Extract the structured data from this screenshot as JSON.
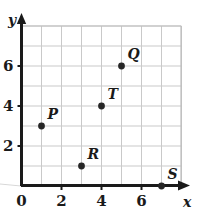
{
  "chart_data": {
    "type": "scatter",
    "title": "",
    "xlabel": "x",
    "ylabel": "y",
    "xlim": [
      0,
      8
    ],
    "ylim": [
      0,
      8
    ],
    "grid": true,
    "grid_step": 1,
    "legend": "none",
    "x_ticks": [
      {
        "value": 0,
        "label": "0"
      },
      {
        "value": 2,
        "label": "2"
      },
      {
        "value": 4,
        "label": "4"
      },
      {
        "value": 6,
        "label": "6"
      }
    ],
    "y_ticks": [
      {
        "value": 0,
        "label": "0"
      },
      {
        "value": 2,
        "label": "2"
      },
      {
        "value": 4,
        "label": "4"
      },
      {
        "value": 6,
        "label": "6"
      }
    ],
    "points": [
      {
        "label": "P",
        "x": 1,
        "y": 3
      },
      {
        "label": "R",
        "x": 3,
        "y": 1
      },
      {
        "label": "T",
        "x": 4,
        "y": 4
      },
      {
        "label": "Q",
        "x": 5,
        "y": 6
      },
      {
        "label": "S",
        "x": 7,
        "y": 0
      }
    ],
    "colors": {
      "point": "#262626",
      "axis": "#1a1a1a",
      "grid": "#c9c9c9",
      "background": "#ffffff"
    }
  },
  "axes": {
    "x_name": "x",
    "y_name": "y",
    "origin_label": "0"
  }
}
